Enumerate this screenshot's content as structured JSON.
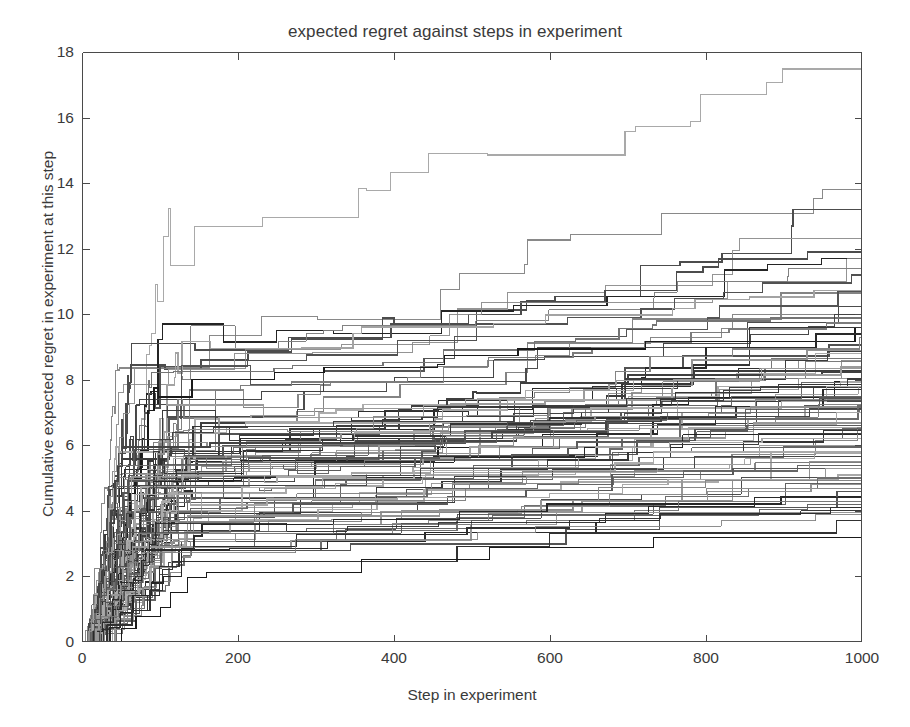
{
  "chart_data": {
    "type": "line",
    "subtype": "step",
    "title": "expected regret against steps in experiment",
    "xlabel": "Step in experiment",
    "ylabel": "Cumulative expected regret in experiment at this step",
    "xlim": [
      0,
      1000
    ],
    "ylim": [
      0,
      18
    ],
    "xticks": [
      0,
      200,
      400,
      600,
      800,
      1000
    ],
    "yticks": [
      0,
      2,
      4,
      6,
      8,
      10,
      12,
      14,
      16,
      18
    ],
    "xtick_labels": [
      "0",
      "200",
      "400",
      "600",
      "800",
      "1000"
    ],
    "ytick_labels": [
      "0",
      "2",
      "4",
      "6",
      "8",
      "10",
      "12",
      "14",
      "16",
      "18"
    ],
    "grid": false,
    "legend": null,
    "legend_position": "none",
    "box": true,
    "tick_direction": "in",
    "n_series": 100,
    "series_colors_note": "grayscale, line luminance varies from light gray (#b4b4b4) to near black (#1a1a1a)",
    "notable_series": [
      {
        "name": "max-regret-run",
        "final_value": 17.8,
        "note": "top curve; reaches ceiling ~17.8 near step 465 then flat"
      },
      {
        "name": "second-run",
        "final_value": 14.2,
        "note": "steps up to 14.2 around step 710"
      },
      {
        "name": "third-run",
        "final_value": 13.2,
        "note": "final jump near step 905"
      },
      {
        "name": "fourth-run",
        "final_value": 12.3
      },
      {
        "name": "median-band",
        "final_value": 8.0,
        "note": "dense cluster of curves ending between 7 and 9"
      },
      {
        "name": "min-regret-run",
        "final_value": 3.5,
        "note": "lowest curve, flat after ~step 520"
      }
    ],
    "final_values": [
      17.8,
      14.2,
      13.2,
      12.3,
      12.1,
      11.9,
      11.7,
      11.5,
      11.4,
      11.2,
      10.9,
      10.7,
      10.5,
      10.4,
      10.2,
      10.0,
      9.9,
      9.8,
      9.6,
      9.5,
      9.4,
      9.3,
      9.2,
      9.1,
      9.0,
      8.9,
      8.85,
      8.8,
      8.7,
      8.65,
      8.6,
      8.55,
      8.5,
      8.45,
      8.4,
      8.35,
      8.3,
      8.25,
      8.2,
      8.15,
      8.1,
      8.05,
      8.0,
      7.95,
      7.9,
      7.85,
      7.8,
      7.75,
      7.7,
      7.65,
      7.6,
      7.5,
      7.45,
      7.4,
      7.35,
      7.3,
      7.25,
      7.2,
      7.1,
      7.0,
      6.9,
      6.85,
      6.8,
      6.7,
      6.6,
      6.55,
      6.5,
      6.45,
      6.4,
      6.35,
      6.3,
      6.2,
      6.1,
      6.0,
      5.9,
      5.8,
      5.75,
      5.7,
      5.6,
      5.55,
      5.5,
      5.4,
      5.3,
      5.2,
      5.1,
      5.0,
      4.9,
      4.85,
      4.8,
      4.7,
      4.6,
      4.5,
      4.4,
      4.3,
      4.2,
      4.1,
      4.0,
      3.9,
      3.7,
      3.5
    ],
    "rise_knee_steps": "most curves complete 60-80% of their total regret within the first 150 steps"
  },
  "axes": {
    "axis_color": "#4a4a4a",
    "text_color": "#3a3a3a",
    "background": "#ffffff"
  }
}
